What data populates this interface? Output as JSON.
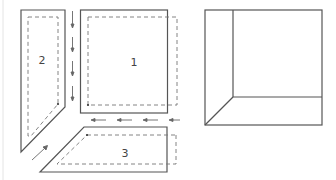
{
  "diagram": {
    "left_figure": {
      "panels": [
        {
          "id": "panel-1",
          "label": "1"
        },
        {
          "id": "panel-2",
          "label": "2"
        },
        {
          "id": "panel-3",
          "label": "3"
        }
      ],
      "arrows": [
        {
          "id": "arrows-down",
          "direction": "down",
          "count": 4
        },
        {
          "id": "arrows-left",
          "direction": "left",
          "count": 4
        },
        {
          "id": "arrow-diagonal",
          "direction": "up-right",
          "count": 1
        }
      ]
    },
    "right_figure": {
      "description": "assembled corner view"
    },
    "colors": {
      "line": "#555555",
      "dash": "#777777",
      "background": "#ffffff"
    }
  }
}
